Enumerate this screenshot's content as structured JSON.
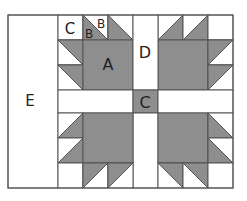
{
  "diagram": {
    "colors": {
      "dark": "#8e8e8e",
      "light": "#ffffff",
      "line": "#555555"
    },
    "labels": {
      "E": "E",
      "C_corner": "C",
      "B_light": "B",
      "B_dark": "B",
      "A": "A",
      "D": "D",
      "C_center": "C"
    }
  }
}
